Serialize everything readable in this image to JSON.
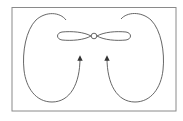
{
  "diagram": {
    "title": "",
    "colors": {
      "background": "#ffffff",
      "frame": "#8a8a8a",
      "stroke": "#555555",
      "arrow": "#333333"
    },
    "elements": [
      {
        "id": "frame",
        "type": "rectangle"
      },
      {
        "id": "propeller",
        "type": "two-blade propeller with hub"
      },
      {
        "id": "left-airflow-loop",
        "type": "curved arrow",
        "direction": "up"
      },
      {
        "id": "right-airflow-loop",
        "type": "curved arrow",
        "direction": "up"
      }
    ]
  }
}
